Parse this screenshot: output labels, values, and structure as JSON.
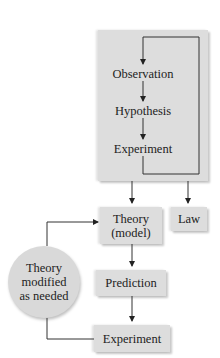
{
  "diagram": {
    "title": "",
    "method_box": {
      "steps": [
        "Observation",
        "Hypothesis",
        "Experiment"
      ]
    },
    "theory": {
      "line1": "Theory",
      "line2": "(model)"
    },
    "law": "Law",
    "prediction": "Prediction",
    "experiment": "Experiment",
    "feedback": {
      "line1": "Theory",
      "line2": "modified",
      "line3": "as needed"
    },
    "colors": {
      "box": "#dddddd",
      "circle": "#d9d9d9",
      "line": "#333333"
    }
  }
}
